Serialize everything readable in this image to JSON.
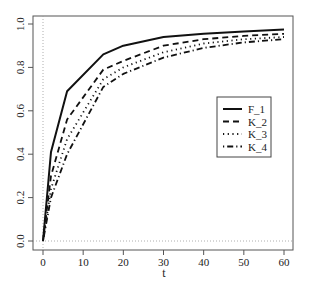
{
  "chart_data": {
    "type": "line",
    "title": "",
    "xlabel": "t",
    "ylabel": "",
    "xlim": [
      -1.5,
      63
    ],
    "ylim": [
      -0.02,
      1.03
    ],
    "x_ticks": [
      0,
      10,
      20,
      30,
      40,
      50,
      60
    ],
    "y_ticks": [
      0.0,
      0.2,
      0.4,
      0.6,
      0.8,
      1.0
    ],
    "x_tick_labels": [
      "0",
      "10",
      "20",
      "30",
      "40",
      "50",
      "60"
    ],
    "y_tick_labels": [
      "0.0",
      "0.2",
      "0.4",
      "0.6",
      "0.8",
      "1.0"
    ],
    "grid": false,
    "reference_lines": [
      {
        "orientation": "vertical",
        "value": 0,
        "style": "dotted"
      },
      {
        "orientation": "horizontal",
        "value": 0,
        "style": "dotted"
      }
    ],
    "legend_position": "right-center",
    "x": [
      0,
      2,
      6,
      15,
      20,
      30,
      40,
      50,
      60
    ],
    "series": [
      {
        "name": "F_1",
        "style": "solid",
        "values": [
          0.0,
          0.41,
          0.69,
          0.86,
          0.9,
          0.94,
          0.955,
          0.965,
          0.975
        ]
      },
      {
        "name": "K_2",
        "style": "dashed",
        "values": [
          0.0,
          0.3,
          0.56,
          0.79,
          0.83,
          0.9,
          0.93,
          0.945,
          0.955
        ]
      },
      {
        "name": "K_3",
        "style": "dotted",
        "values": [
          0.0,
          0.24,
          0.47,
          0.745,
          0.8,
          0.87,
          0.91,
          0.93,
          0.94
        ]
      },
      {
        "name": "K_4",
        "style": "dotdash",
        "values": [
          0.0,
          0.2,
          0.4,
          0.71,
          0.77,
          0.845,
          0.89,
          0.915,
          0.93
        ]
      }
    ]
  },
  "legend": {
    "items": [
      {
        "label": "F_1"
      },
      {
        "label": "K_2"
      },
      {
        "label": "K_3"
      },
      {
        "label": "K_4"
      }
    ]
  },
  "axis": {
    "xlabel": "t"
  }
}
